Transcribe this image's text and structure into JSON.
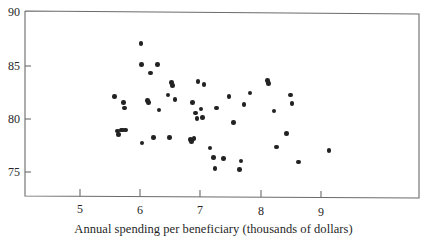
{
  "figure": {
    "caption": "Annual spending per beneficiary (thousands of dollars)",
    "background_color": "#ffffff",
    "marker_color": "#222222",
    "axis_color": "#555555"
  },
  "axes": {
    "y_ticks": [
      "75",
      "80",
      "85",
      "90"
    ],
    "x_ticks": [
      "5",
      "6",
      "7",
      "8",
      "9"
    ]
  },
  "chart_data": {
    "type": "scatter",
    "title": "",
    "xlabel": "Annual spending per beneficiary (thousands of dollars)",
    "ylabel": "",
    "xlim": [
      4.35,
      9.9
    ],
    "ylim": [
      73.1,
      90.0
    ],
    "xticks": [
      5,
      6,
      7,
      8,
      9
    ],
    "yticks": [
      75,
      80,
      85,
      90
    ],
    "grid": false,
    "legend": null,
    "marker": "filled-circle",
    "n_points": 56,
    "points": [
      {
        "x": 5.57,
        "y": 82.15
      },
      {
        "x": 5.62,
        "y": 78.85
      },
      {
        "x": 5.64,
        "y": 78.55
      },
      {
        "x": 5.68,
        "y": 78.95
      },
      {
        "x": 5.71,
        "y": 78.95
      },
      {
        "x": 5.72,
        "y": 81.55
      },
      {
        "x": 5.74,
        "y": 81.05
      },
      {
        "x": 5.76,
        "y": 78.95
      },
      {
        "x": 6.01,
        "y": 87.15
      },
      {
        "x": 6.02,
        "y": 85.15
      },
      {
        "x": 6.03,
        "y": 77.75
      },
      {
        "x": 6.12,
        "y": 81.75
      },
      {
        "x": 6.14,
        "y": 81.55
      },
      {
        "x": 6.17,
        "y": 84.35
      },
      {
        "x": 6.22,
        "y": 78.25
      },
      {
        "x": 6.29,
        "y": 85.15
      },
      {
        "x": 6.31,
        "y": 80.85
      },
      {
        "x": 6.46,
        "y": 82.25
      },
      {
        "x": 6.49,
        "y": 78.25
      },
      {
        "x": 6.52,
        "y": 83.45
      },
      {
        "x": 6.54,
        "y": 83.15
      },
      {
        "x": 6.58,
        "y": 81.85
      },
      {
        "x": 6.83,
        "y": 78.05
      },
      {
        "x": 6.85,
        "y": 77.85
      },
      {
        "x": 6.87,
        "y": 81.55
      },
      {
        "x": 6.89,
        "y": 78.15
      },
      {
        "x": 6.92,
        "y": 80.55
      },
      {
        "x": 6.94,
        "y": 80.05
      },
      {
        "x": 6.96,
        "y": 83.55
      },
      {
        "x": 7.01,
        "y": 80.95
      },
      {
        "x": 7.03,
        "y": 80.15
      },
      {
        "x": 7.06,
        "y": 83.25
      },
      {
        "x": 7.16,
        "y": 77.25
      },
      {
        "x": 7.22,
        "y": 76.35
      },
      {
        "x": 7.24,
        "y": 75.35
      },
      {
        "x": 7.27,
        "y": 81.05
      },
      {
        "x": 7.38,
        "y": 76.25
      },
      {
        "x": 7.47,
        "y": 82.15
      },
      {
        "x": 7.55,
        "y": 79.65
      },
      {
        "x": 7.65,
        "y": 75.25
      },
      {
        "x": 7.67,
        "y": 76.05
      },
      {
        "x": 7.72,
        "y": 81.35
      },
      {
        "x": 7.82,
        "y": 82.45
      },
      {
        "x": 8.11,
        "y": 83.65
      },
      {
        "x": 8.13,
        "y": 83.35
      },
      {
        "x": 8.22,
        "y": 80.75
      },
      {
        "x": 8.26,
        "y": 77.35
      },
      {
        "x": 8.43,
        "y": 78.65
      },
      {
        "x": 8.49,
        "y": 82.25
      },
      {
        "x": 8.52,
        "y": 81.45
      },
      {
        "x": 8.63,
        "y": 75.95
      },
      {
        "x": 9.13,
        "y": 77.05
      }
    ]
  }
}
